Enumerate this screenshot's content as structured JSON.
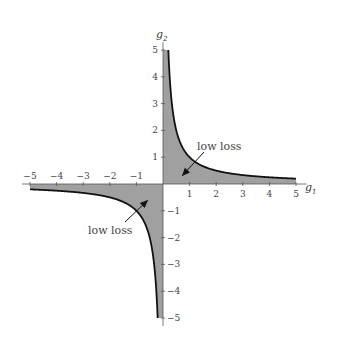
{
  "chart_data": {
    "type": "area",
    "title": "",
    "xlabel": "g",
    "xlabel_sub": "1",
    "ylabel": "g",
    "ylabel_sub": "2",
    "xlim": [
      -5,
      5
    ],
    "ylim": [
      -5,
      5
    ],
    "grid": false,
    "x_ticks": [
      -5,
      -4,
      -3,
      -2,
      -1,
      1,
      2,
      3,
      4,
      5
    ],
    "y_ticks": [
      -5,
      -4,
      -3,
      -2,
      -1,
      1,
      2,
      3,
      4,
      5
    ],
    "x_tick_labels": [
      "−5",
      "−4",
      "−3",
      "−2",
      "−1",
      "1",
      "2",
      "3",
      "4",
      "5"
    ],
    "y_tick_labels": [
      "−5",
      "−4",
      "−3",
      "−2",
      "−1",
      "1",
      "2",
      "3",
      "4",
      "5"
    ],
    "series": [
      {
        "name": "boundary Q1 (g1·g2 = 1)",
        "x": [
          0.2,
          0.25,
          0.33,
          0.5,
          0.75,
          1,
          1.5,
          2,
          3,
          4,
          5
        ],
        "y": [
          5,
          4,
          3,
          2,
          1.33,
          1,
          0.67,
          0.5,
          0.33,
          0.25,
          0.2
        ]
      },
      {
        "name": "boundary Q3 (g1·g2 = 1)",
        "x": [
          -5,
          -4,
          -3,
          -2,
          -1.5,
          -1,
          -0.75,
          -0.5,
          -0.33,
          -0.25,
          -0.2
        ],
        "y": [
          -0.2,
          -0.25,
          -0.33,
          -0.5,
          -0.67,
          -1,
          -1.33,
          -2,
          -3,
          -4,
          -5
        ]
      }
    ],
    "annotations": [
      {
        "text": "low loss",
        "arrow_to": [
          0.6,
          0.3
        ],
        "text_at": [
          1.3,
          1.0
        ]
      },
      {
        "text": "low loss",
        "arrow_to": [
          -0.6,
          -0.3
        ],
        "text_at": [
          -2.0,
          -1.6
        ]
      }
    ],
    "colors": {
      "fill": "#a0a0a0",
      "curve": "#111111",
      "axis": "#555555"
    }
  }
}
